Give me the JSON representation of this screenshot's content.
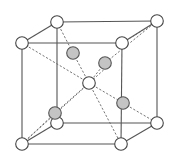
{
  "diagram": {
    "title": "",
    "type": "crystal-unit-cell",
    "colors": {
      "edge": "#555555",
      "bond": "#666666",
      "white_atom_fill": "#ffffff",
      "white_atom_stroke": "#444444",
      "gray_atom_fill": "#c4c4c4",
      "gray_atom_stroke": "#555555"
    },
    "radius": 6.3,
    "nodes": {
      "btl": [
        57,
        22
      ],
      "btr": [
        157,
        21
      ],
      "ftl": [
        22,
        43
      ],
      "ftr": [
        122,
        43
      ],
      "bbl": [
        57,
        123
      ],
      "bbr": [
        157,
        123
      ],
      "fbl": [
        22,
        144
      ],
      "fbr": [
        121,
        144
      ],
      "center": [
        89,
        83
      ],
      "g1": [
        73,
        53
      ],
      "g2": [
        105,
        63
      ],
      "g3": [
        55,
        113
      ],
      "g4": [
        123,
        103
      ]
    },
    "white_atoms": [
      "btl",
      "btr",
      "ftl",
      "ftr",
      "bbl",
      "bbr",
      "fbl",
      "fbr",
      "center"
    ],
    "gray_atoms": [
      "g1",
      "g2",
      "g3",
      "g4"
    ],
    "solid_edges": [
      [
        "btl",
        "btr"
      ],
      [
        "ftl",
        "ftr"
      ],
      [
        "bbl",
        "bbr"
      ],
      [
        "fbl",
        "fbr"
      ],
      [
        "btl",
        "ftl"
      ],
      [
        "btr",
        "ftr"
      ],
      [
        "bbl",
        "fbl"
      ],
      [
        "bbr",
        "fbr"
      ],
      [
        "btl",
        "bbl"
      ],
      [
        "btr",
        "bbr"
      ],
      [
        "ftl",
        "fbl"
      ],
      [
        "ftr",
        "fbr"
      ]
    ],
    "dashed_bonds": [
      [
        "ftl",
        "center"
      ],
      [
        "btl",
        "g1"
      ],
      [
        "g1",
        "center"
      ],
      [
        "btr",
        "g2"
      ],
      [
        "g2",
        "center"
      ],
      [
        "fbl",
        "g3"
      ],
      [
        "g3",
        "center"
      ],
      [
        "center",
        "g4"
      ],
      [
        "g4",
        "bbr"
      ],
      [
        "center",
        "fbr"
      ],
      [
        "fbl",
        "ftr_offset"
      ],
      [
        "ftr",
        "btr_offset"
      ]
    ],
    "extra_points": {
      "ftr_offset": [
        108,
        66
      ],
      "btr_offset": [
        153,
        24
      ]
    }
  }
}
